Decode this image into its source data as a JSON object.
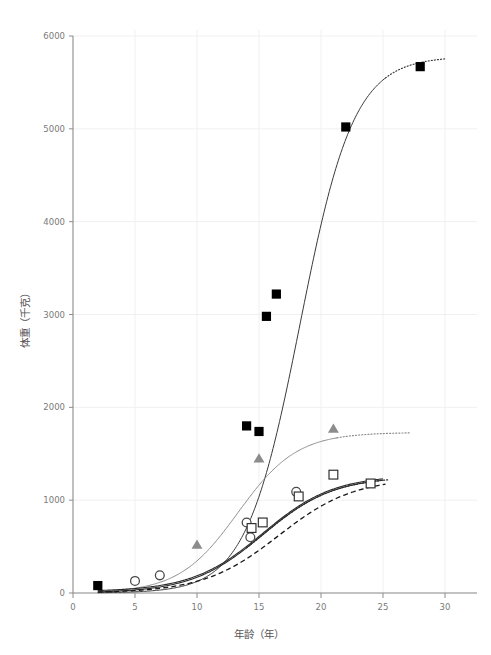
{
  "chart_data": {
    "type": "scatter",
    "title": "",
    "subtitle": "",
    "xlabel": "年龄（年）",
    "ylabel": "体重（千克）",
    "xlim": [
      0,
      30
    ],
    "ylim": [
      0,
      6000
    ],
    "xticks": [
      0,
      5,
      10,
      15,
      20,
      25,
      30
    ],
    "yticks": [
      0,
      1000,
      2000,
      3000,
      4000,
      5000,
      6000
    ],
    "xtick_labels": [
      "0",
      "5",
      "10",
      "15",
      "20",
      "25",
      "30"
    ],
    "ytick_labels": [
      "0",
      "1000",
      "2000",
      "3000",
      "4000",
      "5000",
      "6000"
    ],
    "grid": true,
    "legend": "none",
    "annotations": [],
    "series": [
      {
        "name": "filled-square-series",
        "marker": "filled-square",
        "marker_color": "#000000",
        "line_color": "#3a3a3a",
        "line_style": "solid-with-dotted-extrapolation",
        "points": [
          {
            "x": 2,
            "y": 80
          },
          {
            "x": 14,
            "y": 1800
          },
          {
            "x": 15,
            "y": 1740
          },
          {
            "x": 15.6,
            "y": 2980
          },
          {
            "x": 16.4,
            "y": 3220
          },
          {
            "x": 22,
            "y": 5020
          },
          {
            "x": 28,
            "y": 5670
          }
        ],
        "curve": {
          "model": "logistic",
          "asymptote": 5780,
          "midpoint": 18.3,
          "rate": 0.46,
          "solid_range": [
            2,
            25.2
          ],
          "dotted_range": [
            25.2,
            30
          ]
        }
      },
      {
        "name": "gray-triangle-series",
        "marker": "filled-triangle",
        "marker_color": "#8c8c8c",
        "line_color": "#8c8c8c",
        "line_style": "solid-with-dotted-extrapolation",
        "points": [
          {
            "x": 10,
            "y": 520
          },
          {
            "x": 15,
            "y": 1450
          },
          {
            "x": 21,
            "y": 1770
          }
        ],
        "curve": {
          "model": "logistic",
          "asymptote": 1730,
          "midpoint": 13.3,
          "rate": 0.42,
          "solid_range": [
            2,
            21.3
          ],
          "dotted_range": [
            21.3,
            27.2
          ]
        }
      },
      {
        "name": "open-circle-series",
        "marker": "open-circle",
        "marker_color": "#4a4a4a",
        "line_color": "#2b2b2b",
        "line_style": "double-solid",
        "points": [
          {
            "x": 5,
            "y": 130
          },
          {
            "x": 7,
            "y": 190
          },
          {
            "x": 14,
            "y": 760
          },
          {
            "x": 14.3,
            "y": 600
          },
          {
            "x": 18,
            "y": 1090
          }
        ],
        "curve": {
          "model": "logistic",
          "asymptote": 1255,
          "midpoint": 15.3,
          "rate": 0.35,
          "solid_range": [
            2,
            25.0
          ],
          "dotted_range": [
            18,
            25.0
          ]
        }
      },
      {
        "name": "open-square-series",
        "marker": "open-square",
        "marker_color": "#2b2b2b",
        "line_color": "#1a1a1a",
        "line_style": "dashed",
        "points": [
          {
            "x": 14.4,
            "y": 700
          },
          {
            "x": 15.3,
            "y": 760
          },
          {
            "x": 18.2,
            "y": 1040
          },
          {
            "x": 21,
            "y": 1275
          },
          {
            "x": 24,
            "y": 1180
          }
        ],
        "curve": {
          "model": "logistic",
          "asymptote": 1240,
          "midpoint": 16.6,
          "rate": 0.33,
          "solid_range": [
            2,
            25.2
          ],
          "dotted_range": []
        }
      }
    ]
  },
  "axes": {
    "x_axis_name": "年龄（年）",
    "y_axis_name": "体重（千克）"
  }
}
